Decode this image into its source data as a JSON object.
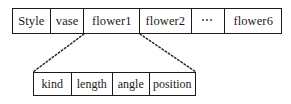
{
  "diagram": {
    "type": "record-structure-expansion",
    "record_table": {
      "name": "style-record",
      "cells": [
        {
          "label": "Style"
        },
        {
          "label": "vase"
        },
        {
          "label": "flower1"
        },
        {
          "label": "flower2"
        },
        {
          "label": "⋯"
        },
        {
          "label": "flower6"
        }
      ]
    },
    "detail_table": {
      "name": "flower-attributes",
      "expands_from": "flower1",
      "cells": [
        {
          "label": "kind"
        },
        {
          "label": "length"
        },
        {
          "label": "angle"
        },
        {
          "label": "position"
        }
      ]
    },
    "connectors": [
      {
        "name": "left-connector",
        "style": "dashed",
        "from": "flower1-bottom-left",
        "to": "detail-table-top-left"
      },
      {
        "name": "right-connector",
        "style": "dashed",
        "from": "flower1-bottom-right",
        "to": "detail-table-top-right"
      }
    ],
    "colors": {
      "border": "#1c1c1c",
      "background": "#ffffff",
      "text": "#1a1a1a",
      "connector": "#2a2a2a"
    }
  }
}
